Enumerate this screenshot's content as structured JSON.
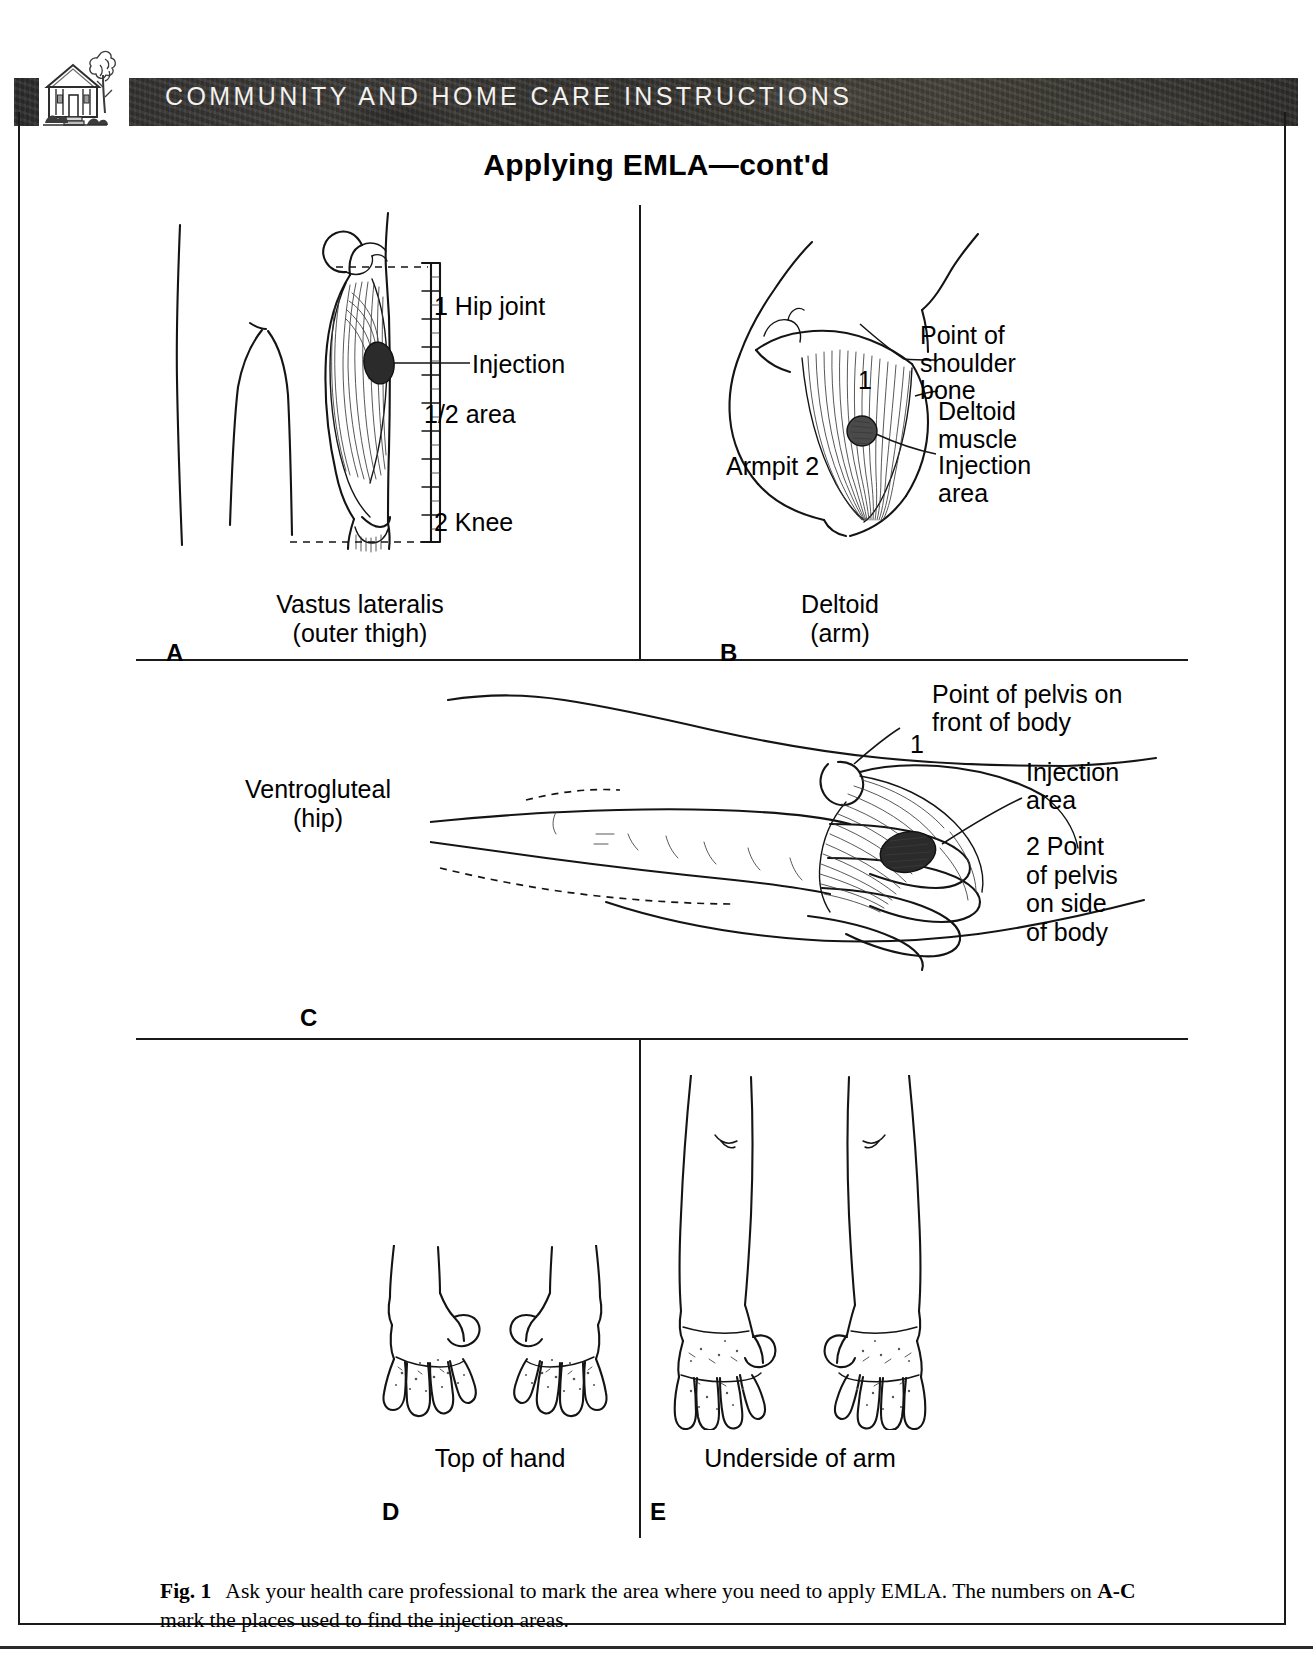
{
  "header": {
    "banner_title": "COMMUNITY AND HOME CARE INSTRUCTIONS",
    "logo_icon": "house-and-tree-icon",
    "banner_color": "#35332f",
    "banner_text_color": "#f4f2ef"
  },
  "page": {
    "title": "Applying EMLA—cont'd",
    "border_color": "#1a1a1a"
  },
  "panels": {
    "a": {
      "letter": "A",
      "caption_line1": "Vastus lateralis",
      "caption_line2": "(outer thigh)",
      "labels": {
        "hip_joint": "1 Hip joint",
        "injection": "Injection",
        "half_area": "1/2  area",
        "knee": "2 Knee"
      }
    },
    "b": {
      "letter": "B",
      "caption_line1": "Deltoid",
      "caption_line2": "(arm)",
      "labels": {
        "point_of_shoulder_bone": "Point of\nshoulder\nbone",
        "deltoid_muscle": "Deltoid\nmuscle",
        "injection_area": "Injection\narea",
        "armpit": "Armpit 2",
        "marker_one": "1"
      }
    },
    "c": {
      "letter": "C",
      "caption_line1": "Ventrogluteal",
      "caption_line2": "(hip)",
      "labels": {
        "point_of_pelvis_front": "Point of pelvis on\nfront of body",
        "injection_area": "Injection\narea",
        "point_of_pelvis_side": "2 Point\nof pelvis\non side\nof body",
        "marker_one": "1"
      }
    },
    "d": {
      "letter": "D",
      "caption_line1": "Top of hand"
    },
    "e": {
      "letter": "E",
      "caption_line1": "Underside of arm"
    }
  },
  "figure": {
    "label": "Fig. 1",
    "text_part1": "Ask your health care professional to mark the area where you need to apply EMLA. The numbers on ",
    "bold_ref": "A-C",
    "text_part2": " mark the places used to find the injection areas."
  }
}
